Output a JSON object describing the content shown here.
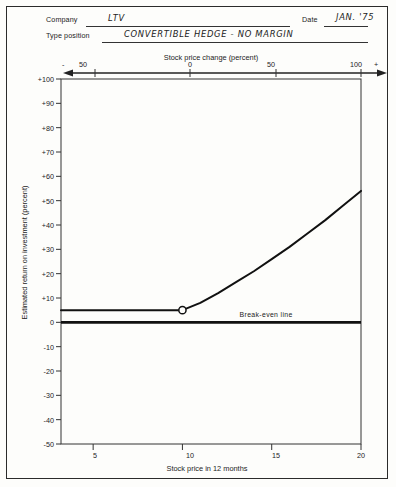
{
  "form": {
    "company_label": "Company",
    "company_value": "LTV",
    "date_label": "Date",
    "date_value": "JAN. '75",
    "type_label": "Type position",
    "type_value": "CONVERTIBLE   HEDGE  -  NO  MARGIN"
  },
  "chart_data": {
    "type": "line",
    "title": "Stock price change (percent)",
    "xlabel": "Stock price in 12 months",
    "ylabel": "Estimated return on investment (percent)",
    "top_axis_label": "Stock price change (percent)",
    "top_axis_ticks": [
      "50",
      "0",
      "50",
      "100"
    ],
    "top_axis_tick_values": [
      -50,
      0,
      50,
      100
    ],
    "top_axis_minus_sign": "-",
    "top_axis_plus_sign": "+",
    "x_ticks": [
      "5",
      "10",
      "15",
      "20"
    ],
    "x_tick_values": [
      5,
      10,
      15,
      20
    ],
    "xlim": [
      3.2,
      20
    ],
    "y_ticks": [
      "+100",
      "+90",
      "+80",
      "+70",
      "+60",
      "+50",
      "+40",
      "+30",
      "+20",
      "+10",
      "0",
      "-10",
      "-20",
      "-30",
      "-40",
      "-50"
    ],
    "y_tick_values": [
      100,
      90,
      80,
      70,
      60,
      50,
      40,
      30,
      20,
      10,
      0,
      -10,
      -20,
      -30,
      -40,
      -50
    ],
    "ylim": [
      -50,
      100
    ],
    "grid": false,
    "legend": "none",
    "breakeven_label": "Break-even line",
    "breakeven_value": 0,
    "marker": {
      "x": 10,
      "y": 5,
      "style": "open-circle"
    },
    "series": [
      {
        "name": "Estimated return on investment",
        "x": [
          3.2,
          5,
          7,
          9,
          10,
          11,
          12,
          13,
          14,
          15,
          16,
          17,
          18,
          19,
          20
        ],
        "values": [
          5,
          5,
          5,
          5,
          5,
          8,
          12,
          16.5,
          21,
          26,
          31,
          36.5,
          42,
          48,
          54
        ]
      }
    ]
  }
}
